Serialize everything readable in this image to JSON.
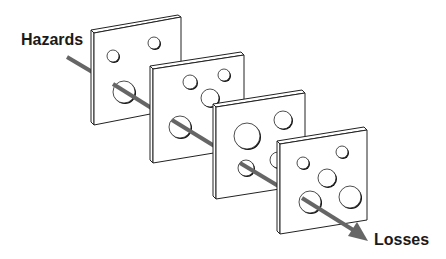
{
  "diagram": {
    "labels": {
      "start": "Hazards",
      "end": "Losses"
    },
    "colors": {
      "arrow": "#666666",
      "slice_fill": "#ffffff",
      "slice_stroke": "#222222",
      "label": "#1a1a1a"
    },
    "slices": [
      {
        "id": 1,
        "holes": 3
      },
      {
        "id": 2,
        "holes": 4
      },
      {
        "id": 3,
        "holes": 4
      },
      {
        "id": 4,
        "holes": 5
      }
    ]
  }
}
